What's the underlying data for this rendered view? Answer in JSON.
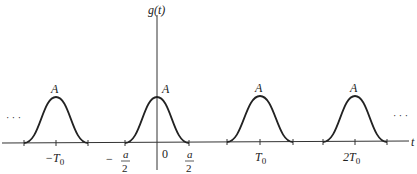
{
  "diagram": {
    "type": "periodic-pulse-train",
    "y_axis_label": "g(t)",
    "x_axis_label": "t",
    "pulse_peak_label": "A",
    "ellipsis_left": "· · ·",
    "ellipsis_right": "· · ·",
    "pulses": [
      {
        "center_label": "−T",
        "center_sub": "0",
        "peak": "A"
      },
      {
        "center_label": "0",
        "center_sub": "",
        "peak": "A"
      },
      {
        "center_label": "T",
        "center_sub": "0",
        "peak": "A"
      },
      {
        "center_label": "2T",
        "center_sub": "0",
        "peak": "A"
      }
    ],
    "tick_labels": {
      "neg_half_width": {
        "sign": "−",
        "num": "a",
        "den": "2"
      },
      "pos_half_width": {
        "num": "a",
        "den": "2"
      },
      "origin": "0"
    },
    "colors": {
      "stroke": "#222222",
      "background": "#ffffff"
    }
  }
}
